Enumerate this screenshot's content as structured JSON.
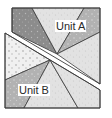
{
  "diagram": {
    "units": [
      {
        "id": "A",
        "label": "Unit A"
      },
      {
        "id": "B",
        "label": "Unit B"
      }
    ],
    "colors": {
      "dark_gray": "#8a8a8a",
      "medium_gray": "#b4b4b4",
      "light_gray": "#dcdcdc",
      "very_light": "#ececec",
      "outline": "#3a3a3a",
      "background": "#ffffff"
    }
  }
}
